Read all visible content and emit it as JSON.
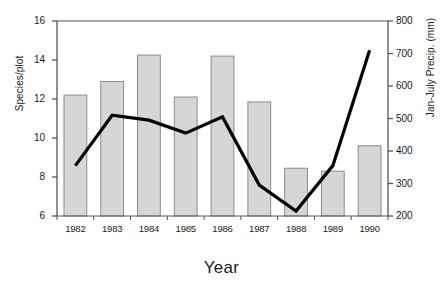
{
  "chart_data": {
    "type": "bar",
    "title": "",
    "xlabel": "Year",
    "ylabel": "Species/plot",
    "ylabel_right": "Jan-July Precip. (mm)",
    "categories": [
      "1982",
      "1983",
      "1984",
      "1985",
      "1986",
      "1987",
      "1988",
      "1989",
      "1990"
    ],
    "ylim": [
      6,
      16
    ],
    "ylim_right": [
      200,
      800
    ],
    "yticks": [
      "6",
      "8",
      "10",
      "12",
      "14",
      "16"
    ],
    "yticks_right": [
      "200",
      "300",
      "400",
      "500",
      "600",
      "700",
      "800"
    ],
    "grid": false,
    "legend": "none",
    "series": [
      {
        "name": "Species/plot",
        "type": "bar",
        "axis": "left",
        "color": "#d6d6d6",
        "edge_color": "#8c8c8c",
        "values": [
          12.2,
          12.9,
          14.25,
          12.1,
          14.2,
          11.85,
          8.45,
          8.3,
          9.6
        ]
      },
      {
        "name": "Jan-July Precip. (mm)",
        "type": "line",
        "axis": "right",
        "color": "#000000",
        "values": [
          355,
          510,
          495,
          455,
          505,
          295,
          215,
          355,
          710
        ]
      }
    ]
  },
  "axes": {
    "left": {
      "label": "Species/plot",
      "ticks": [
        {
          "value": 16,
          "label": "16"
        },
        {
          "value": 14,
          "label": "14"
        },
        {
          "value": 12,
          "label": "12"
        },
        {
          "value": 10,
          "label": "10"
        },
        {
          "value": 8,
          "label": "8"
        },
        {
          "value": 6,
          "label": "6"
        }
      ]
    },
    "right": {
      "label": "Jan-July Precip. (mm)",
      "ticks": [
        {
          "value": 800,
          "label": "800"
        },
        {
          "value": 700,
          "label": "700"
        },
        {
          "value": 600,
          "label": "600"
        },
        {
          "value": 500,
          "label": "500"
        },
        {
          "value": 400,
          "label": "400"
        },
        {
          "value": 300,
          "label": "300"
        },
        {
          "value": 200,
          "label": "200"
        }
      ]
    },
    "bottom": {
      "label": "Year",
      "ticks": [
        "1982",
        "1983",
        "1984",
        "1985",
        "1986",
        "1987",
        "1988",
        "1989",
        "1990"
      ]
    }
  },
  "style": {
    "background": "#ffffff",
    "axis_color": "#555555",
    "bar_fill": "#d6d6d6",
    "bar_edge": "#8c8c8c",
    "line_color": "#000000"
  }
}
